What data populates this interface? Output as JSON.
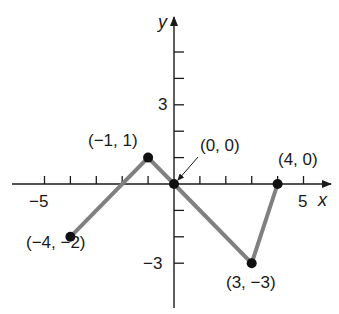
{
  "chart_data": {
    "type": "line",
    "title": "",
    "xlabel": "x",
    "ylabel": "y",
    "xlim": [
      -6,
      6
    ],
    "ylim": [
      -4,
      6
    ],
    "grid": false,
    "x_tick_labels": [
      {
        "value": -5,
        "label": "−5"
      },
      {
        "value": 5,
        "label": "5"
      }
    ],
    "y_tick_labels": [
      {
        "value": 3,
        "label": "3"
      },
      {
        "value": -3,
        "label": "−3"
      }
    ],
    "x_ticks": [
      -5,
      -4,
      -3,
      -2,
      -1,
      1,
      2,
      3,
      4,
      5
    ],
    "y_ticks": [
      -3,
      -2,
      -1,
      1,
      2,
      3,
      4,
      5
    ],
    "series": [
      {
        "name": "piecewise linear graph",
        "color": "#808080",
        "x": [
          -4,
          -1,
          0,
          3,
          4
        ],
        "y": [
          -2,
          1,
          0,
          -3,
          0
        ]
      }
    ],
    "points": [
      {
        "x": -4,
        "y": -2,
        "label": "(−4, −2)"
      },
      {
        "x": -1,
        "y": 1,
        "label": "(−1, 1)"
      },
      {
        "x": 0,
        "y": 0,
        "label": "(0, 0)"
      },
      {
        "x": 3,
        "y": -3,
        "label": "(3, −3)"
      },
      {
        "x": 4,
        "y": 0,
        "label": "(4, 0)"
      }
    ],
    "annotations": [
      {
        "text": "(0, 0)",
        "arrow_to": [
          0,
          0
        ]
      }
    ]
  },
  "colors": {
    "axis": "#1a1a1a",
    "line": "#808080",
    "point": "#111111"
  }
}
